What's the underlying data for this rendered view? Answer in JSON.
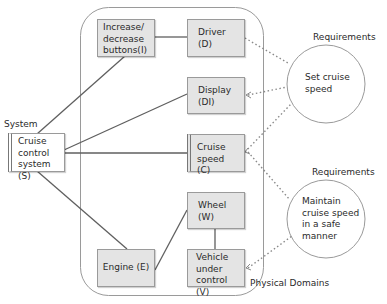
{
  "diagram": {
    "type": "problem-frame",
    "container": {
      "label": "Physical Domains"
    },
    "system": {
      "heading": "System",
      "box": {
        "id": "S",
        "label": "Cruise control system (S)",
        "lines": [
          "Cruise",
          "control",
          "system (S)"
        ]
      }
    },
    "domains": [
      {
        "id": "I",
        "lines": [
          "Increase/",
          "decrease",
          "buttons(I)"
        ]
      },
      {
        "id": "D",
        "lines": [
          "Driver",
          "(D)"
        ]
      },
      {
        "id": "DI",
        "lines": [
          "Display",
          "(DI)"
        ]
      },
      {
        "id": "C",
        "lines": [
          "Cruise",
          "speed (C)"
        ]
      },
      {
        "id": "W",
        "lines": [
          "Wheel",
          "(W)"
        ]
      },
      {
        "id": "V",
        "lines": [
          "Vehicle",
          "under",
          "control (V)"
        ]
      },
      {
        "id": "E",
        "lines": [
          "Engine (E)"
        ]
      }
    ],
    "requirements": [
      {
        "heading": "Requirements",
        "lines": [
          "Set cruise",
          "speed"
        ],
        "refs": [
          "D",
          "DI",
          "C"
        ]
      },
      {
        "heading": "Requirements",
        "lines": [
          "Maintain",
          "cruise speed",
          "in a safe",
          "manner"
        ],
        "refs": [
          "C",
          "V"
        ]
      }
    ],
    "connections": [
      [
        "S",
        "I"
      ],
      [
        "S",
        "DI"
      ],
      [
        "S",
        "C"
      ],
      [
        "S",
        "E"
      ],
      [
        "I",
        "D"
      ],
      [
        "E",
        "W"
      ],
      [
        "W",
        "V"
      ]
    ],
    "colors": {
      "box_fill": "#e4e4e4",
      "box_border": "#9a9a9a",
      "line": "#5f5f5f",
      "dotted": "#8a8a8a"
    }
  }
}
